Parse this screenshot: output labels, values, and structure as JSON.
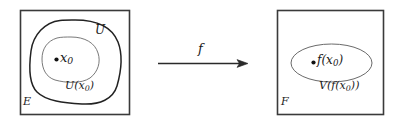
{
  "figure": {
    "type": "set-mapping-diagram",
    "background_color": "#ffffff",
    "stroke_color": "#1a1a1a",
    "domain_panel": {
      "space_label": "E",
      "outer_set_label": "U",
      "inner_set_label_base": "U",
      "inner_set_label_arg": "x",
      "inner_set_label_sub": "0",
      "point_label_base": "x",
      "point_label_sub": "0",
      "point_marker": "filled-dot"
    },
    "mapping": {
      "arrow_label": "f",
      "arrow_direction": "right"
    },
    "codomain_panel": {
      "space_label": "F",
      "set_label_prefix": "V(",
      "set_label_inner": "f(x",
      "set_label_sub": "0",
      "set_label_suffix": "))",
      "point_label_prefix": "f(x",
      "point_label_sub": "0",
      "point_label_suffix": ")",
      "point_marker": "filled-dot"
    }
  }
}
